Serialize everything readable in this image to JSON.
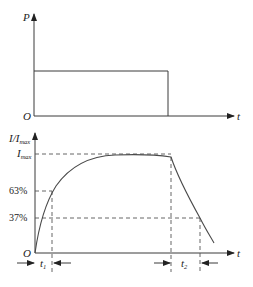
{
  "top_chart": {
    "y_axis_label": "P",
    "x_axis_label": "t",
    "origin_label": "O"
  },
  "bottom_chart": {
    "y_axis_label_main": "I/I",
    "y_axis_label_sub": "max",
    "x_axis_label": "t",
    "origin_label": "O",
    "imax_label_main": "I",
    "imax_label_sub": "max",
    "pct_63_label": "63%",
    "pct_37_label": "37%",
    "t1_label_main": "t",
    "t1_label_sub": "1",
    "t2_label_main": "t",
    "t2_label_sub": "2"
  },
  "colors": {
    "line": "#3a3a3a",
    "background": "#ffffff"
  }
}
